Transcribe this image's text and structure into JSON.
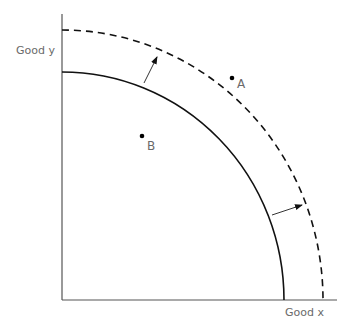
{
  "diagram": {
    "axes": {
      "y_label": "Good y",
      "x_label": "Good x"
    },
    "curves": [
      {
        "name": "original-ppf",
        "style": "solid"
      },
      {
        "name": "shifted-ppf",
        "style": "dashed"
      }
    ],
    "points": [
      {
        "label": "A"
      },
      {
        "label": "B"
      }
    ],
    "arrows": [
      {
        "name": "outward-shift-arrow-top"
      },
      {
        "name": "outward-shift-arrow-right"
      }
    ],
    "colors": {
      "line": "#111111",
      "axis": "#555555",
      "text": "#6a6a6a"
    }
  }
}
